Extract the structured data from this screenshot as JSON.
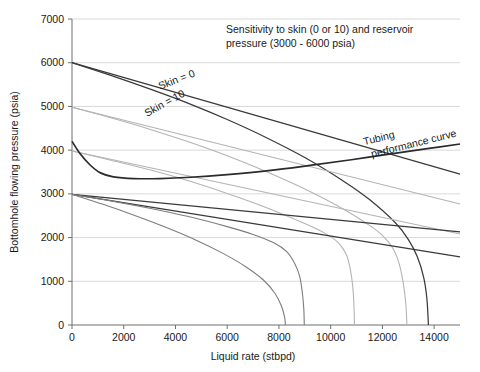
{
  "chart_data": {
    "type": "line",
    "title_line1": "Sensitivity to skin (0 or 10) and reservoir",
    "title_line2": "pressure (3000 - 6000 psia)",
    "xlabel": "Liquid rate (stbpd)",
    "ylabel": "Bottomhole flowing pressure (psia)",
    "xlim": [
      0,
      15000
    ],
    "ylim": [
      0,
      7000
    ],
    "grid": true,
    "legend": "none",
    "xticks": [
      0,
      2000,
      4000,
      6000,
      8000,
      10000,
      12000,
      14000
    ],
    "xtick_labels": [
      "0",
      "2000",
      "4000",
      "6000",
      "8000",
      "10000",
      "12000",
      "14000"
    ],
    "yticks": [
      0,
      1000,
      2000,
      3000,
      4000,
      5000,
      6000,
      7000
    ],
    "ytick_labels": [
      "0",
      "1000",
      "2000",
      "3000",
      "4000",
      "5000",
      "6000",
      "7000"
    ],
    "annotations": [
      {
        "text": "Skin = 0",
        "x": 3400,
        "y": 5380,
        "rotation": -21
      },
      {
        "text": "Skin = 10",
        "x": 2900,
        "y": 4760,
        "rotation": -29
      },
      {
        "text": "Tubing",
        "x": 11300,
        "y": 4110,
        "rotation": -14
      },
      {
        "text": "performance curve",
        "x": 11600,
        "y": 3830,
        "rotation": -14
      }
    ],
    "series": [
      {
        "name": "IPR reservoir 6000 psia, skin = 0",
        "style": "dark-straight",
        "points": [
          [
            0,
            6000
          ],
          [
            15000,
            3450
          ]
        ]
      },
      {
        "name": "IPR reservoir 6000 psia, skin = 10",
        "style": "dark-vogel",
        "points": [
          [
            0,
            6000
          ],
          [
            1500,
            5710
          ],
          [
            3000,
            5400
          ],
          [
            4500,
            5070
          ],
          [
            6000,
            4700
          ],
          [
            7500,
            4290
          ],
          [
            9000,
            3830
          ],
          [
            10500,
            3290
          ],
          [
            11500,
            2870
          ],
          [
            12500,
            2340
          ],
          [
            13000,
            1960
          ],
          [
            13350,
            1560
          ],
          [
            13600,
            1080
          ],
          [
            13720,
            600
          ],
          [
            13780,
            0
          ]
        ]
      },
      {
        "name": "IPR reservoir 5000 psia, skin = 0",
        "style": "light-straight",
        "points": [
          [
            0,
            4980
          ],
          [
            15000,
            2770
          ]
        ]
      },
      {
        "name": "IPR reservoir 5000 psia, skin = 10",
        "style": "light-vogel",
        "points": [
          [
            0,
            4980
          ],
          [
            1500,
            4740
          ],
          [
            3000,
            4480
          ],
          [
            4500,
            4190
          ],
          [
            6000,
            3870
          ],
          [
            7500,
            3510
          ],
          [
            9000,
            3110
          ],
          [
            10500,
            2650
          ],
          [
            11500,
            2280
          ],
          [
            12000,
            2050
          ],
          [
            12400,
            1760
          ],
          [
            12650,
            1400
          ],
          [
            12800,
            980
          ],
          [
            12900,
            520
          ],
          [
            12950,
            0
          ]
        ]
      },
      {
        "name": "IPR reservoir 4000 psia, skin = 0",
        "style": "light-straight",
        "points": [
          [
            0,
            3980
          ],
          [
            15000,
            2080
          ]
        ]
      },
      {
        "name": "IPR reservoir 4000 psia, skin = 10",
        "style": "light-vogel",
        "points": [
          [
            0,
            3980
          ],
          [
            1500,
            3770
          ],
          [
            3000,
            3550
          ],
          [
            4500,
            3300
          ],
          [
            6000,
            3010
          ],
          [
            7500,
            2690
          ],
          [
            9000,
            2320
          ],
          [
            9800,
            2090
          ],
          [
            10300,
            1880
          ],
          [
            10600,
            1620
          ],
          [
            10750,
            1300
          ],
          [
            10850,
            900
          ],
          [
            10900,
            450
          ],
          [
            10920,
            0
          ]
        ]
      },
      {
        "name": "IPR reservoir 3000 psia, skin = 0 (upper)",
        "style": "dark-straight",
        "points": [
          [
            0,
            2990
          ],
          [
            15000,
            2130
          ]
        ]
      },
      {
        "name": "IPR reservoir 3000 psia, mid",
        "style": "dark-straight",
        "points": [
          [
            0,
            2990
          ],
          [
            15000,
            1560
          ]
        ]
      },
      {
        "name": "IPR reservoir 3000 psia, skin = 10",
        "style": "mid-vogel",
        "points": [
          [
            0,
            2990
          ],
          [
            1500,
            2840
          ],
          [
            3000,
            2670
          ],
          [
            4500,
            2480
          ],
          [
            6000,
            2250
          ],
          [
            7000,
            2070
          ],
          [
            7800,
            1880
          ],
          [
            8300,
            1680
          ],
          [
            8600,
            1420
          ],
          [
            8800,
            1120
          ],
          [
            8900,
            760
          ],
          [
            8960,
            380
          ],
          [
            8980,
            0
          ]
        ]
      },
      {
        "name": "IPR reservoir 3000 psia, steep",
        "style": "mid-vogel",
        "points": [
          [
            0,
            2990
          ],
          [
            1200,
            2760
          ],
          [
            2400,
            2510
          ],
          [
            3600,
            2240
          ],
          [
            4800,
            1940
          ],
          [
            5800,
            1650
          ],
          [
            6700,
            1340
          ],
          [
            7400,
            1030
          ],
          [
            7850,
            720
          ],
          [
            8100,
            430
          ],
          [
            8220,
            180
          ],
          [
            8250,
            0
          ]
        ]
      },
      {
        "name": "Tubing performance curve",
        "style": "tubing",
        "points": [
          [
            0,
            4200
          ],
          [
            300,
            3930
          ],
          [
            700,
            3660
          ],
          [
            1100,
            3480
          ],
          [
            1600,
            3390
          ],
          [
            2400,
            3350
          ],
          [
            3400,
            3350
          ],
          [
            4600,
            3380
          ],
          [
            6000,
            3440
          ],
          [
            7600,
            3530
          ],
          [
            9200,
            3650
          ],
          [
            10800,
            3780
          ],
          [
            12400,
            3920
          ],
          [
            13800,
            4040
          ],
          [
            15000,
            4140
          ]
        ]
      }
    ]
  },
  "plot_geometry": {
    "left": 72,
    "right": 460,
    "top": 19,
    "bottom": 325
  }
}
